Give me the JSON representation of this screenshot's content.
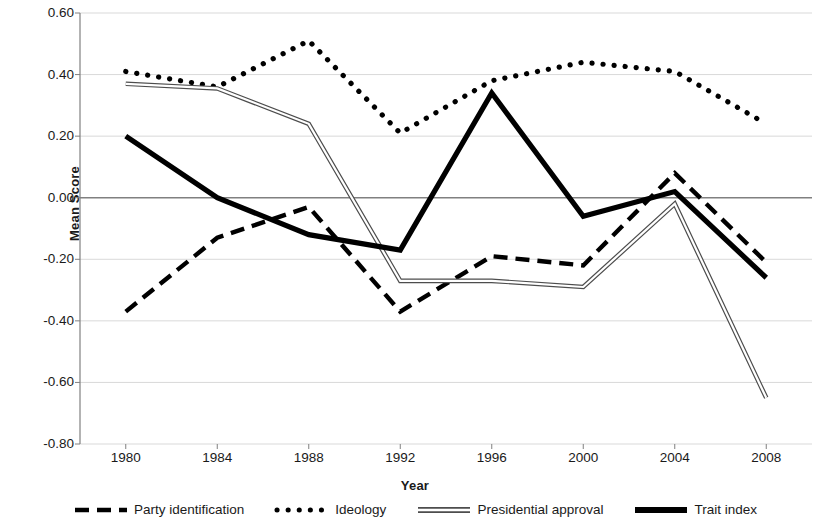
{
  "chart_data": {
    "type": "line",
    "title": "",
    "xlabel": "Year",
    "ylabel": "Mean Score",
    "x": [
      1980,
      1984,
      1988,
      1992,
      1996,
      2000,
      2004,
      2008
    ],
    "xticklabels": [
      "1980",
      "1984",
      "1988",
      "1992",
      "1996",
      "2000",
      "2004",
      "2008"
    ],
    "yticks": [
      0.6,
      0.4,
      0.2,
      0.0,
      -0.2,
      -0.4,
      -0.6,
      -0.8
    ],
    "yticklabels": [
      "0.60",
      "0.40",
      "0.20",
      "0.00",
      "-0.20",
      "-0.40",
      "-0.60",
      "-0.80"
    ],
    "ylim": [
      -0.8,
      0.6
    ],
    "xlim": [
      1980,
      2008
    ],
    "grid": true,
    "legend_position": "bottom",
    "series": [
      {
        "name": "Party identification",
        "style": "dashed",
        "color": "#000000",
        "values": [
          -0.37,
          -0.13,
          -0.03,
          -0.37,
          -0.19,
          -0.22,
          0.08,
          -0.21
        ]
      },
      {
        "name": "Ideology",
        "style": "dotted",
        "color": "#000000",
        "values": [
          0.41,
          0.36,
          0.51,
          0.21,
          0.38,
          0.44,
          0.41,
          0.24
        ]
      },
      {
        "name": "Presidential approval",
        "style": "double-thin",
        "color": "#595959",
        "values": [
          0.37,
          0.355,
          0.24,
          -0.27,
          -0.27,
          -0.29,
          -0.02,
          -0.65
        ]
      },
      {
        "name": "Trait index",
        "style": "solid-thick",
        "color": "#000000",
        "values": [
          0.2,
          0.0,
          -0.12,
          -0.17,
          0.34,
          -0.06,
          0.02,
          -0.26
        ]
      }
    ]
  },
  "legend": {
    "items": [
      {
        "label": "Party identification",
        "icon": "dashed-line-icon"
      },
      {
        "label": "Ideology",
        "icon": "dotted-line-icon"
      },
      {
        "label": "Presidential approval",
        "icon": "double-line-icon"
      },
      {
        "label": "Trait index",
        "icon": "thick-line-icon"
      }
    ]
  },
  "colors": {
    "grid": "#d9d9d9",
    "zero_line": "#808080",
    "axis": "#808080",
    "text": "#1a1a1a"
  }
}
